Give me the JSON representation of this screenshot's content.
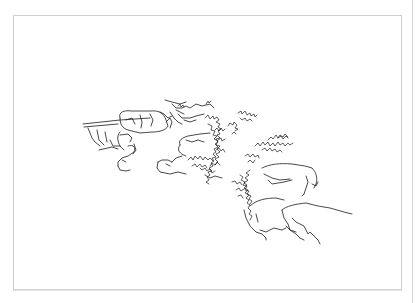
{
  "image": {
    "description": "Pen line-drawing sketch of rocky cliff ledges with scrubby vegetation, drawn inside a thin light-gray bordered frame",
    "subject": "rock outcrops and shrubs",
    "style": "black ink line art on white",
    "colors": {
      "background": "#ffffff",
      "ink": "#1a1a1a",
      "frame_border": "#cfcfcf"
    }
  },
  "frame": {
    "left": 13,
    "top": 15,
    "right": 401,
    "bottom": 289
  }
}
